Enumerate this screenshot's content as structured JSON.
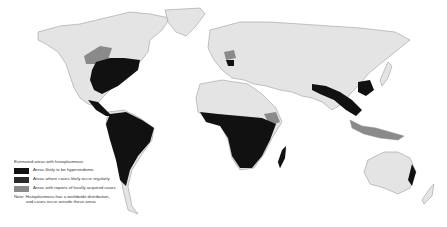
{
  "legend": {
    "title": "Estimated areas with histoplasmosis",
    "items": [
      {
        "label": "Areas likely to be hyperendemic",
        "color": "#111111"
      },
      {
        "label": "Areas where cases likely occur regularly",
        "color": "#2a2a2a"
      },
      {
        "label": "Areas with reports of locally acquired cases",
        "color": "#8a8a8a"
      }
    ],
    "note_line1": "Note: Histoplasmosis has a worldwide distribution,",
    "note_line2": "and cases occur outside these areas"
  },
  "colors": {
    "land": "#e4e4e4",
    "border": "#8c8c8c",
    "hyperendemic": "#111111",
    "regular": "#2a2a2a",
    "sporadic": "#8a8a8a",
    "water": "#ffffff"
  }
}
